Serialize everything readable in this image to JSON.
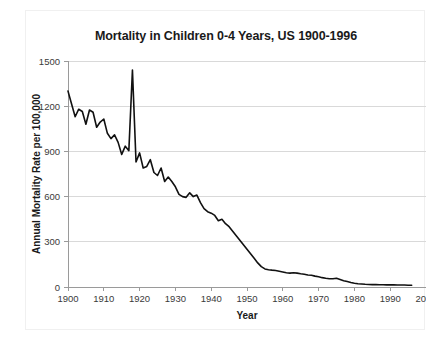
{
  "chart_data": {
    "type": "line",
    "title": "Mortality in Children 0-4 Years, US 1900-1996",
    "xlabel": "Year",
    "ylabel": "Annual Mortality Rate per 100,000",
    "xlim": [
      1900,
      2000
    ],
    "ylim": [
      0,
      1500
    ],
    "xticks": [
      1900,
      1910,
      1920,
      1930,
      1940,
      1950,
      1960,
      1970,
      1980,
      1990,
      2000
    ],
    "yticks": [
      0,
      300,
      600,
      900,
      1200,
      1500
    ],
    "grid": true,
    "legend": "none",
    "series_color": "#111111",
    "series": [
      {
        "name": "Annual Mortality Rate per 100,000",
        "x": [
          1900,
          1901,
          1902,
          1903,
          1904,
          1905,
          1906,
          1907,
          1908,
          1909,
          1910,
          1911,
          1912,
          1913,
          1914,
          1915,
          1916,
          1917,
          1918,
          1919,
          1920,
          1921,
          1922,
          1923,
          1924,
          1925,
          1926,
          1927,
          1928,
          1929,
          1930,
          1931,
          1932,
          1933,
          1934,
          1935,
          1936,
          1937,
          1938,
          1939,
          1940,
          1941,
          1942,
          1943,
          1944,
          1945,
          1946,
          1947,
          1948,
          1949,
          1950,
          1951,
          1952,
          1953,
          1954,
          1955,
          1956,
          1957,
          1958,
          1959,
          1960,
          1961,
          1962,
          1963,
          1964,
          1965,
          1966,
          1967,
          1968,
          1969,
          1970,
          1971,
          1972,
          1973,
          1974,
          1975,
          1976,
          1977,
          1978,
          1979,
          1980,
          1981,
          1982,
          1983,
          1984,
          1985,
          1986,
          1987,
          1988,
          1989,
          1990,
          1991,
          1992,
          1993,
          1994,
          1995,
          1996
        ],
        "values": [
          1300,
          1215,
          1130,
          1180,
          1165,
          1080,
          1175,
          1160,
          1060,
          1095,
          1115,
          1020,
          985,
          1010,
          960,
          880,
          935,
          905,
          1440,
          830,
          890,
          790,
          800,
          845,
          760,
          740,
          790,
          700,
          730,
          700,
          665,
          615,
          600,
          595,
          625,
          600,
          610,
          560,
          520,
          500,
          490,
          475,
          440,
          450,
          420,
          400,
          370,
          340,
          310,
          280,
          250,
          220,
          190,
          160,
          135,
          120,
          115,
          112,
          110,
          105,
          100,
          95,
          92,
          95,
          92,
          88,
          85,
          80,
          78,
          72,
          68,
          62,
          58,
          55,
          55,
          58,
          50,
          42,
          36,
          30,
          25,
          22,
          20,
          18,
          17,
          16,
          16,
          15,
          15,
          14,
          14,
          14,
          13,
          13,
          13,
          12,
          12
        ]
      }
    ],
    "annotations": [
      {
        "label": "1918 influenza pandemic spike",
        "x": 1918,
        "y": 1440
      }
    ]
  }
}
